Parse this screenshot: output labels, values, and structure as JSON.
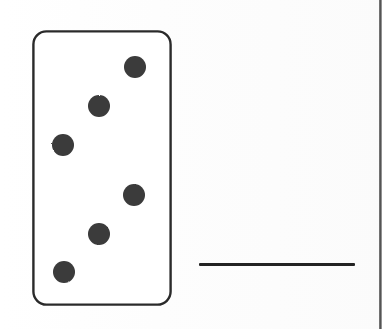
{
  "document": {
    "type": "worksheet-exercise",
    "description": "Domino tile with blank answer line",
    "background_color": "#ffffff",
    "ink_color": "#232323",
    "pip_color": "#3a3a3a"
  },
  "domino": {
    "label": "domino-tile",
    "top_half": {
      "label": "top-half",
      "pip_count": "3",
      "pips": [
        {
          "name": "pip-top-right",
          "cx": 103,
          "cy": 37,
          "r": 11
        },
        {
          "name": "pip-center",
          "cx": 67,
          "cy": 76,
          "r": 11
        },
        {
          "name": "pip-bottom-left",
          "cx": 31,
          "cy": 115,
          "r": 11
        }
      ]
    },
    "divider": {
      "label": "center-divider-line",
      "x1": 16,
      "x2": 128,
      "y": 140
    },
    "bottom_half": {
      "label": "bottom-half",
      "pip_count": "3",
      "pips": [
        {
          "name": "pip-top-right",
          "cx": 102,
          "cy": 165,
          "r": 11
        },
        {
          "name": "pip-center",
          "cx": 67,
          "cy": 204,
          "r": 11
        },
        {
          "name": "pip-bottom-left",
          "cx": 32,
          "cy": 242,
          "r": 11
        }
      ]
    },
    "outline": {
      "corner_radius": 13,
      "stroke_width": 2.4,
      "fill": "#ffffff"
    },
    "total_pips": "6"
  },
  "answer_blank": {
    "label": "answer-blank-line",
    "value": "",
    "placeholder": ""
  },
  "scan_artifact": {
    "label": "page-edge-shadow"
  }
}
